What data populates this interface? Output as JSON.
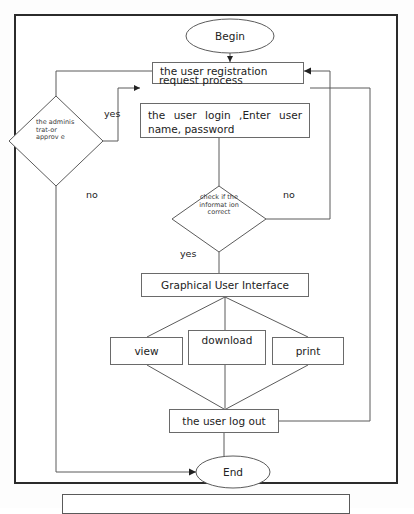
{
  "figure": {
    "caption": "",
    "frame_border_color": "#2b2b2b",
    "line_color": "#5b5b5b"
  },
  "flowchart": {
    "type": "flowchart",
    "title": "User registration and login flow",
    "nodes": [
      {
        "id": "begin",
        "shape": "ellipse",
        "label": "Begin"
      },
      {
        "id": "register",
        "shape": "process",
        "label_line1": "the user registration",
        "label_line2": "request process"
      },
      {
        "id": "admin",
        "shape": "decision",
        "label": "the adminis trat-or approv e"
      },
      {
        "id": "login",
        "shape": "process",
        "label": "the  user  login  ,Enter  user name, password"
      },
      {
        "id": "check",
        "shape": "decision",
        "label": "check if the informat ion correct"
      },
      {
        "id": "gui",
        "shape": "process",
        "label": "Graphical User Interface"
      },
      {
        "id": "view",
        "shape": "process",
        "label": "view"
      },
      {
        "id": "download",
        "shape": "process",
        "label": "download"
      },
      {
        "id": "print",
        "shape": "process",
        "label": "print"
      },
      {
        "id": "logout",
        "shape": "process",
        "label": "the user log out"
      },
      {
        "id": "end",
        "shape": "ellipse",
        "label": "End"
      }
    ],
    "edge_labels": {
      "admin_yes": "yes",
      "admin_no": "no",
      "check_no": "no",
      "check_yes": "yes"
    },
    "edges": [
      {
        "from": "begin",
        "to": "register",
        "label": ""
      },
      {
        "from": "register",
        "to": "admin",
        "label": ""
      },
      {
        "from": "admin",
        "to": "login",
        "label": "yes"
      },
      {
        "from": "admin",
        "to": "end",
        "label": "no"
      },
      {
        "from": "login",
        "to": "check",
        "label": ""
      },
      {
        "from": "check",
        "to": "register",
        "label": "no"
      },
      {
        "from": "check",
        "to": "gui",
        "label": "yes"
      },
      {
        "from": "gui",
        "to": "view",
        "label": ""
      },
      {
        "from": "gui",
        "to": "download",
        "label": ""
      },
      {
        "from": "gui",
        "to": "print",
        "label": ""
      },
      {
        "from": "view",
        "to": "logout",
        "label": ""
      },
      {
        "from": "download",
        "to": "logout",
        "label": ""
      },
      {
        "from": "print",
        "to": "logout",
        "label": ""
      },
      {
        "from": "logout",
        "to": "end",
        "label": ""
      },
      {
        "from": "logout",
        "to": "login",
        "label": ""
      }
    ]
  }
}
